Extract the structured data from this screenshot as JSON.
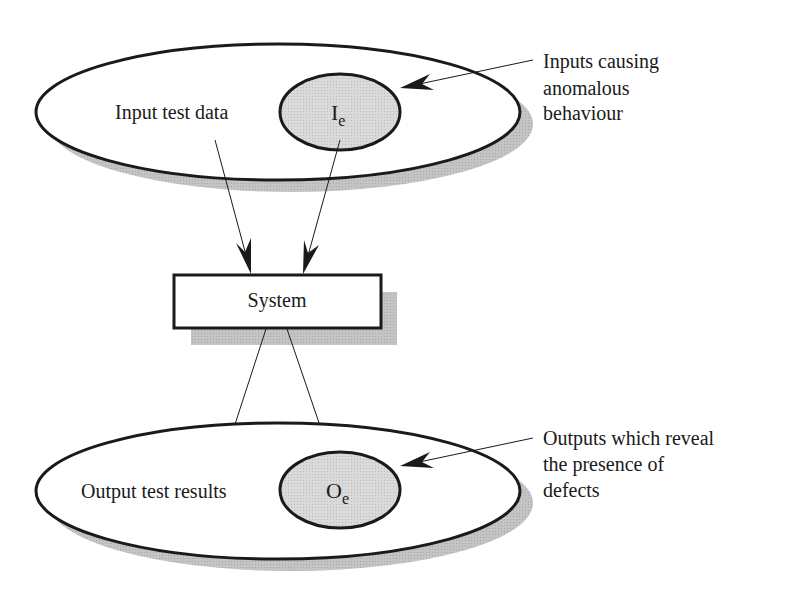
{
  "diagram": {
    "type": "input-output testing model",
    "input_set": {
      "label": "Input test data",
      "subset": {
        "symbol": "I",
        "subscript": "e"
      },
      "callout": [
        "Inputs causing",
        "anomalous",
        "behaviour"
      ]
    },
    "system": {
      "label": "System"
    },
    "output_set": {
      "label": "Output test results",
      "subset": {
        "symbol": "O",
        "subscript": "e"
      },
      "callout": [
        "Outputs which reveal",
        "the presence of",
        "defects"
      ]
    },
    "edges": [
      {
        "from": "input_set",
        "to": "system"
      },
      {
        "from": "input_subset_Ie",
        "to": "system"
      },
      {
        "from": "system",
        "to": "output_set"
      },
      {
        "from": "system",
        "to": "output_subset_Oe"
      }
    ],
    "colors": {
      "stroke": "#1a1a1a",
      "shadow": "#bdbdbd",
      "subset_fill": "#d6d6d6",
      "background": "#ffffff"
    }
  }
}
